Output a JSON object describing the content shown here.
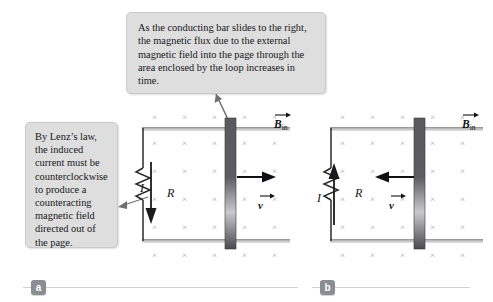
{
  "figure": {
    "title_alt": "Motional emf: conducting bar sliding on rails in a magnetic field into the page",
    "background": "#ffffff"
  },
  "callouts": [
    {
      "id": "top",
      "name": "callout-flux-increase",
      "text": "As the conducting bar slides to the right, the magnetic flux due to the external magnetic field into the page through the area enclosed by the loop increases in time.",
      "fill": "#dedede",
      "border": "#c9c9c9"
    },
    {
      "id": "left",
      "name": "callout-lenz-law",
      "text": "By Lenz’s law, the induced current must be counterclockwise to produce a counteracting magnetic field directed out of the page.",
      "fill": "#dedede",
      "border": "#c9c9c9"
    }
  ],
  "panels": [
    {
      "id": "a",
      "badge": "a",
      "field_label": "B",
      "field_subscript": "in",
      "resistor_label": "R",
      "current_label": "I",
      "current_direction": "down",
      "velocity_label": "v",
      "velocity_direction": "right",
      "bar_position": "center-right"
    },
    {
      "id": "b",
      "badge": "b",
      "field_label": "B",
      "field_subscript": "in",
      "resistor_label": "R",
      "current_label": "I",
      "current_direction": "up",
      "velocity_label": "v",
      "velocity_direction": "left",
      "bar_position": "right"
    }
  ],
  "colors": {
    "wire": "#2b2b2b",
    "rail_light": "#cfcfcf",
    "bar_dark": "#555558",
    "bar_light": "#cfcfd2",
    "xmark": "#a8a8ad",
    "badge": "#8a8d93",
    "rule": "#d2d2d2",
    "text": "#141417"
  },
  "field_symbol": "×"
}
